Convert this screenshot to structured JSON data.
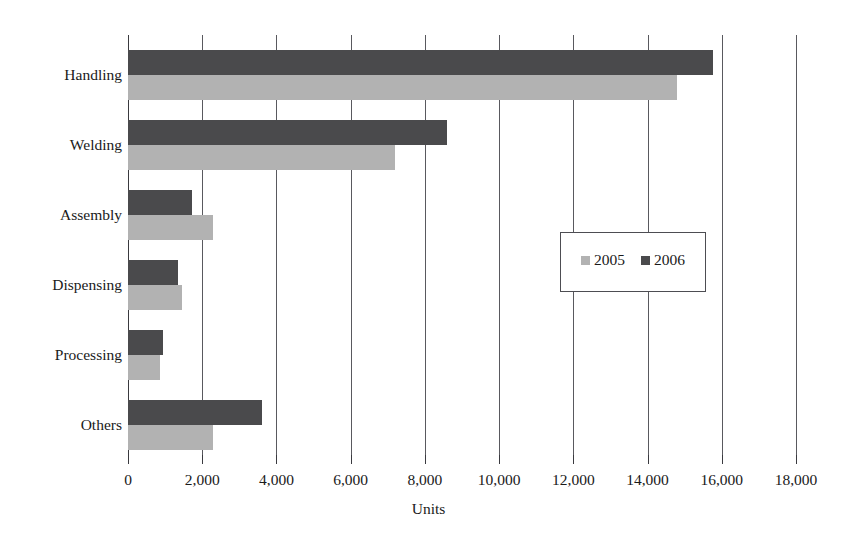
{
  "chart_data": {
    "type": "bar",
    "orientation": "horizontal",
    "title": "",
    "xlabel": "Units",
    "ylabel": "",
    "xlim": [
      0,
      18000
    ],
    "xticks": [
      0,
      2000,
      4000,
      6000,
      8000,
      10000,
      12000,
      14000,
      16000,
      18000
    ],
    "xtick_labels": [
      "0",
      "2,000",
      "4,000",
      "6,000",
      "8,000",
      "10,000",
      "12,000",
      "14,000",
      "16,000",
      "18,000"
    ],
    "categories": [
      "Handling",
      "Welding",
      "Assembly",
      "Dispensing",
      "Processing",
      "Others"
    ],
    "grid": "vertical",
    "legend_position": "center-right",
    "series": [
      {
        "name": "2005",
        "color": "#b2b2b2",
        "values": [
          14800,
          7200,
          2300,
          1450,
          850,
          2300
        ]
      },
      {
        "name": "2006",
        "color": "#4a4a4c",
        "values": [
          15750,
          8600,
          1730,
          1350,
          930,
          3620
        ]
      }
    ]
  },
  "legend": {
    "items": [
      {
        "label": "2005",
        "color": "#b2b2b2"
      },
      {
        "label": "2006",
        "color": "#4a4a4c"
      }
    ]
  },
  "axis": {
    "title": "Units"
  }
}
